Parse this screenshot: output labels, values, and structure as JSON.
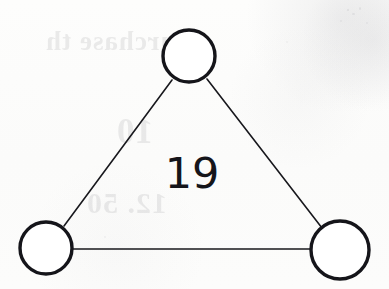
{
  "page": {
    "kind": "scanned-worksheet-page",
    "background_color": "#fcfcfb",
    "ink_color": "#15151a",
    "width": 389,
    "height": 289
  },
  "diagram": {
    "type": "triangle-graph",
    "center_label": "19",
    "nodes": [
      {
        "id": "top",
        "name": "top-node",
        "cx": 189,
        "cy": 56,
        "r": 26,
        "label": ""
      },
      {
        "id": "bottom-left",
        "name": "bottom-left-node",
        "cx": 46,
        "cy": 248,
        "r": 26,
        "label": ""
      },
      {
        "id": "bottom-right",
        "name": "bottom-right-node",
        "cx": 340,
        "cy": 250,
        "r": 29,
        "label": ""
      }
    ],
    "edges": [
      {
        "id": "left-edge",
        "name": "edge-top-to-bottom-left",
        "from": "top",
        "to": "bottom-left"
      },
      {
        "id": "right-edge",
        "name": "edge-top-to-bottom-right",
        "from": "top",
        "to": "bottom-right"
      },
      {
        "id": "bottom-edge",
        "name": "edge-bottom-left-to-bottom-right",
        "from": "bottom-left",
        "to": "bottom-right"
      }
    ],
    "node_stroke_width": 3.4,
    "edge_stroke_width": 1.6
  },
  "bleed_through": {
    "note": "faint mirrored show-through text from the reverse side of the sheet",
    "lines": [
      {
        "text": "Purchase th",
        "name": "ghost-line-1"
      },
      {
        "text": "10",
        "name": "ghost-line-2"
      },
      {
        "text": "12. 50",
        "name": "ghost-line-3"
      }
    ]
  }
}
